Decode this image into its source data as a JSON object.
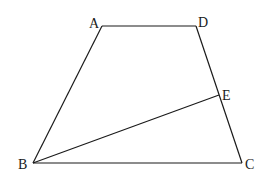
{
  "diagram": {
    "type": "trapezoid",
    "points": {
      "A": {
        "label": "A",
        "x": 102,
        "y": 26,
        "lx": 89,
        "ly": 28
      },
      "D": {
        "label": "D",
        "x": 196,
        "y": 26,
        "lx": 198,
        "ly": 27
      },
      "E": {
        "label": "E",
        "x": 219,
        "y": 95,
        "lx": 222,
        "ly": 100
      },
      "B": {
        "label": "B",
        "x": 33,
        "y": 163,
        "lx": 18,
        "ly": 169
      },
      "C": {
        "label": "C",
        "x": 242,
        "y": 163,
        "lx": 245,
        "ly": 169
      }
    },
    "segments": [
      {
        "from": "A",
        "to": "D"
      },
      {
        "from": "D",
        "to": "C"
      },
      {
        "from": "C",
        "to": "B"
      },
      {
        "from": "B",
        "to": "A"
      },
      {
        "from": "B",
        "to": "E"
      }
    ]
  }
}
